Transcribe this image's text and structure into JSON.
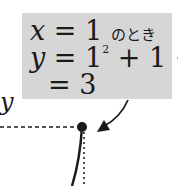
{
  "callout": {
    "line1": {
      "var": "x",
      "eq": " = 1",
      "suffix": "のとき"
    },
    "line2": {
      "var": "y",
      "eq": " = 1",
      "sup": "2",
      "rest": " + 1 + 1"
    },
    "line3": {
      "eq": "= 3"
    }
  },
  "axis_label": "y",
  "point": {
    "x": 1,
    "y": 3
  },
  "colors": {
    "box": "#d6d6d6",
    "ink": "#1a1a1a"
  }
}
